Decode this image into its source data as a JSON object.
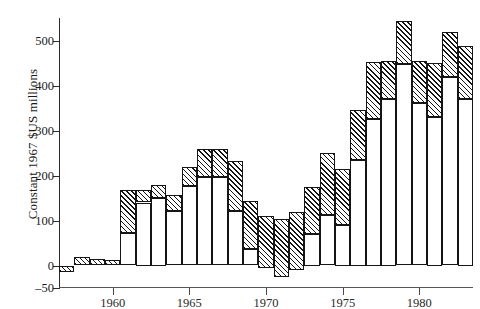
{
  "chart_data": {
    "type": "bar",
    "subtype": "stacked-bar",
    "title": "",
    "xlabel": "",
    "ylabel": "Constant 1967 $US millions",
    "ylim": [
      -50,
      550
    ],
    "yticks": [
      -50,
      0,
      100,
      200,
      300,
      400,
      500
    ],
    "ytick_labels": [
      "–50",
      "0",
      "100",
      "200",
      "300",
      "400",
      "500"
    ],
    "xlim": [
      1956.5,
      1983.5
    ],
    "xticks": [
      1960,
      1965,
      1970,
      1975,
      1980
    ],
    "xtick_labels": [
      "1960",
      "1965",
      "1970",
      "1975",
      "1980"
    ],
    "grid": false,
    "legend": null,
    "categories": [
      1957,
      1958,
      1959,
      1960,
      1961,
      1962,
      1963,
      1964,
      1965,
      1966,
      1967,
      1968,
      1969,
      1970,
      1971,
      1972,
      1973,
      1974,
      1975,
      1976,
      1977,
      1978,
      1979,
      1980,
      1981,
      1982,
      1983
    ],
    "series": [
      {
        "name": "lower (open) segment",
        "fill": "white",
        "values": [
          -14,
          0,
          0,
          0,
          72,
          140,
          150,
          122,
          176,
          196,
          196,
          122,
          36,
          -6,
          -26,
          -10,
          70,
          113,
          90,
          235,
          325,
          370,
          447,
          362,
          330,
          418,
          370
        ]
      },
      {
        "name": "upper (hatched) segment",
        "fill": "hatched",
        "values": [
          14,
          18,
          14,
          12,
          96,
          28,
          28,
          34,
          44,
          62,
          64,
          110,
          108,
          116,
          130,
          128,
          104,
          136,
          125,
          110,
          128,
          85,
          96,
          92,
          121,
          102,
          117
        ]
      }
    ],
    "totals": [
      0,
      18,
      14,
      12,
      168,
      168,
      178,
      156,
      220,
      258,
      260,
      232,
      144,
      110,
      104,
      118,
      174,
      249,
      215,
      345,
      453,
      455,
      543,
      454,
      451,
      520,
      487
    ]
  },
  "axes": {
    "y_title": "Constant 1967 $US millions"
  }
}
